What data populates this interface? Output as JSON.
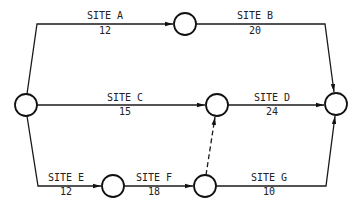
{
  "diagram": {
    "type": "activity-network",
    "nodes": [
      {
        "id": "start",
        "cx": 26,
        "cy": 105
      },
      {
        "id": "n1",
        "cx": 185,
        "cy": 24
      },
      {
        "id": "n2",
        "cx": 217,
        "cy": 105
      },
      {
        "id": "end",
        "cx": 336,
        "cy": 104
      },
      {
        "id": "n3",
        "cx": 113,
        "cy": 186
      },
      {
        "id": "n4",
        "cx": 205,
        "cy": 186
      }
    ],
    "edges": [
      {
        "id": "site-a",
        "name": "SITE A",
        "value": "12"
      },
      {
        "id": "site-b",
        "name": "SITE B",
        "value": "20"
      },
      {
        "id": "site-c",
        "name": "SITE C",
        "value": "15"
      },
      {
        "id": "site-d",
        "name": "SITE D",
        "value": "24"
      },
      {
        "id": "site-e",
        "name": "SITE E",
        "value": "12"
      },
      {
        "id": "site-f",
        "name": "SITE F",
        "value": "18"
      },
      {
        "id": "site-g",
        "name": "SITE G",
        "value": "10"
      },
      {
        "id": "dummy",
        "name": "",
        "value": "",
        "style": "dashed"
      }
    ]
  }
}
